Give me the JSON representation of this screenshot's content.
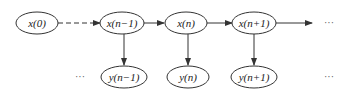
{
  "diagram": {
    "type": "hidden-markov-chain",
    "top_nodes": [
      {
        "id": "x0",
        "label": "x(0)",
        "cx": 37,
        "cy": 23
      },
      {
        "id": "xn-1",
        "label": "x(n−1)",
        "cx": 122,
        "cy": 23
      },
      {
        "id": "xn",
        "label": "x(n)",
        "cx": 186,
        "cy": 23
      },
      {
        "id": "xn+1",
        "label": "x(n+1)",
        "cx": 254,
        "cy": 23
      }
    ],
    "bottom_nodes": [
      {
        "id": "yn-1",
        "label": "y(n−1)",
        "cx": 124,
        "cy": 77
      },
      {
        "id": "yn",
        "label": "y(n)",
        "cx": 188,
        "cy": 77
      },
      {
        "id": "yn+1",
        "label": "y(n+1)",
        "cx": 254,
        "cy": 77
      }
    ],
    "ellipsis": "···",
    "colors": {
      "stroke": "#333333",
      "text": "#222222",
      "background": "#ffffff"
    }
  }
}
